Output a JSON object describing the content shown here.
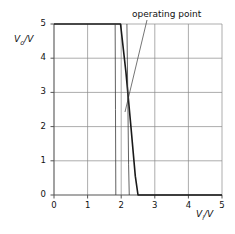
{
  "figure": {
    "annotations": [
      {
        "name": "operating point",
        "text": "operating point",
        "x_px": 132,
        "y_px": 9,
        "leader": {
          "x1": 147,
          "y1": 20,
          "x2": 125,
          "y2": 112
        }
      }
    ]
  },
  "chart_data": {
    "type": "line",
    "title": "",
    "xlabel": "V",
    "xlabel_sub": "i",
    "ylabel": "V",
    "ylabel_sub": "o",
    "xlabel_full": "Vi/V",
    "ylabel_full": "Vo/V",
    "xlim": [
      0,
      5
    ],
    "ylim": [
      0,
      5
    ],
    "xticks": [
      0,
      1,
      2,
      3,
      4,
      5
    ],
    "yticks": [
      0,
      1,
      2,
      3,
      4,
      5
    ],
    "xtick_labels": [
      "0",
      "1",
      "2",
      "3",
      "4",
      "5"
    ],
    "ytick_labels": [
      "0",
      "1",
      "2",
      "3",
      "4",
      "5"
    ],
    "grid": true,
    "grid_color": "#8a8a8a",
    "axis_color": "#555555",
    "legend": "none",
    "series": [
      {
        "name": "inverter transfer characteristic",
        "role": "primary",
        "color": "#1a1a1a",
        "width": 1.6,
        "points": [
          [
            0,
            5
          ],
          [
            1.98,
            5
          ],
          [
            2.14,
            3.6
          ],
          [
            2.28,
            2.1
          ],
          [
            2.42,
            0.55
          ],
          [
            2.5,
            0
          ],
          [
            5,
            0
          ]
        ]
      },
      {
        "name": "mirrored transfer characteristic",
        "role": "mirrored",
        "color": "#3a3a3a",
        "width": 0.8,
        "points": [
          [
            2.17,
            5
          ],
          [
            2.2,
            2.6
          ],
          [
            2.22,
            0.9
          ],
          [
            2.24,
            0
          ]
        ]
      },
      {
        "name": "load line",
        "role": "load",
        "color": "#3a3a3a",
        "width": 0.8,
        "points": [
          [
            1.82,
            5
          ],
          [
            1.83,
            2.5
          ],
          [
            1.84,
            0
          ]
        ]
      }
    ],
    "operating_point": {
      "x": 2.2,
      "y": 2.3,
      "label": "operating point"
    }
  }
}
